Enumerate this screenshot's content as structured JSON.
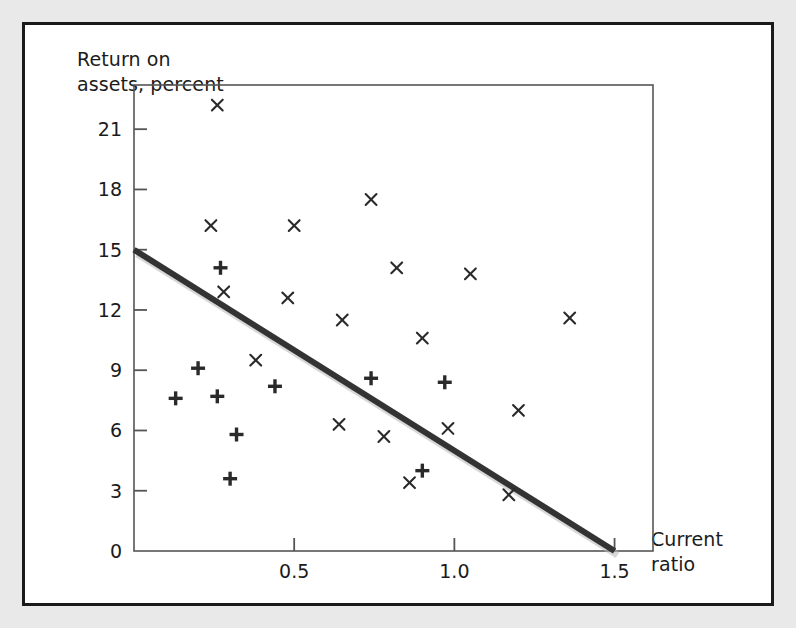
{
  "figure": {
    "background_color": "#e9e9e9",
    "panel_color": "#ffffff",
    "border_color": "#1a1a1a",
    "marker_color": "#2a2a2a",
    "trendline_color": "#333333",
    "axis_color": "#555555"
  },
  "chart_data": {
    "type": "scatter",
    "title": "",
    "xlabel": "Current\nratio",
    "ylabel": "Return on\nassets, percent",
    "xlim": [
      0,
      1.62
    ],
    "ylim": [
      0,
      23.2
    ],
    "xticks": [
      0.5,
      1.0,
      1.5
    ],
    "xtick_labels": [
      "0.5",
      "1.0",
      "1.5"
    ],
    "yticks": [
      0,
      3,
      6,
      9,
      12,
      15,
      18,
      21
    ],
    "ytick_labels": [
      "0",
      "3",
      "6",
      "9",
      "12",
      "15",
      "18",
      "21"
    ],
    "origin_label": "0",
    "grid": false,
    "legend_position": "none",
    "series": [
      {
        "name": "cross-markers",
        "marker": "x",
        "points": [
          [
            0.26,
            22.2
          ],
          [
            0.24,
            16.2
          ],
          [
            0.5,
            16.2
          ],
          [
            0.74,
            17.5
          ],
          [
            0.28,
            12.9
          ],
          [
            0.48,
            12.6
          ],
          [
            0.82,
            14.1
          ],
          [
            1.05,
            13.8
          ],
          [
            1.36,
            11.6
          ],
          [
            0.65,
            11.5
          ],
          [
            0.9,
            10.6
          ],
          [
            0.38,
            9.5
          ],
          [
            0.64,
            6.3
          ],
          [
            0.78,
            5.7
          ],
          [
            0.98,
            6.1
          ],
          [
            1.2,
            7.0
          ],
          [
            0.86,
            3.4
          ],
          [
            1.17,
            2.8
          ]
        ]
      },
      {
        "name": "plus-markers",
        "marker": "+",
        "points": [
          [
            0.27,
            14.1
          ],
          [
            0.2,
            9.1
          ],
          [
            0.13,
            7.6
          ],
          [
            0.26,
            7.7
          ],
          [
            0.44,
            8.2
          ],
          [
            0.74,
            8.6
          ],
          [
            0.97,
            8.4
          ],
          [
            0.32,
            5.8
          ],
          [
            0.9,
            4.0
          ],
          [
            0.3,
            3.6
          ]
        ]
      }
    ],
    "trendline": {
      "name": "fitted-regression-line",
      "from": [
        0.0,
        15.0
      ],
      "to": [
        1.5,
        0.0
      ],
      "slope": -10.0,
      "intercept": 15.0
    }
  }
}
